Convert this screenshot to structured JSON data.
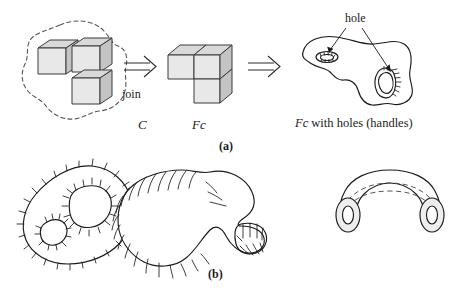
{
  "figure": {
    "width": 459,
    "height": 295,
    "background": "#ffffff",
    "ink_color": "#1a1a1a"
  },
  "panel_a": {
    "sublabel": "(a)",
    "cube_set": {
      "label": "C",
      "label_style": "italic-serif",
      "cube_count": 3,
      "enclosure": "dashed-blob"
    },
    "join_arrow": {
      "glyph": "double-right-arrow",
      "label": "join"
    },
    "joined_solid": {
      "label": "Fc",
      "label_style": "italic-serif",
      "cube_count": 3,
      "arrangement": "L-shape: two cubes top row, one cube below right"
    },
    "second_arrow": {
      "glyph": "double-right-arrow",
      "label": ""
    },
    "holed_solid": {
      "caption_italic": "Fc",
      "caption_rest": " with holes (handles)",
      "annotation": "hole",
      "annotation_arrow_count": 2,
      "hole_count": 2
    }
  },
  "panel_b": {
    "sublabel": "(b)",
    "shapes": [
      {
        "name": "two-holed-disc",
        "description": "hatched blob with two interior holes",
        "hole_count": 2
      },
      {
        "name": "handle-surface",
        "description": "hatched blob with attached handle loop",
        "hole_count": 1
      },
      {
        "name": "tube-torus",
        "description": "shaded bent tube with two circular openings and dashed guide lines",
        "opening_count": 2
      }
    ]
  },
  "colors": {
    "cube_top": "#d9d9d9",
    "cube_front": "#e8e8e8",
    "cube_side": "#c4c4c4",
    "stroke": "#1a1a1a",
    "dashed_stroke": "#555555",
    "tube_cap": "#eeeeee"
  }
}
